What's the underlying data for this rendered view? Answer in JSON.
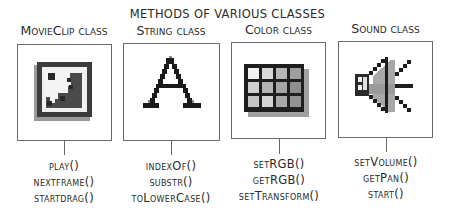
{
  "title": "Methods of various classes",
  "classes": [
    {
      "label": "MovieClip class",
      "icon": "movieclip-icon",
      "methods": [
        "play()",
        "nextFrame()",
        "startDrag()"
      ]
    },
    {
      "label": "String class",
      "icon": "letter-a-icon",
      "methods": [
        "indexOf()",
        "substr()",
        "toLowerCase()"
      ]
    },
    {
      "label": "Color class",
      "icon": "color-grid-icon",
      "methods": [
        "setRGB()",
        "getRGB()",
        "setTransform()"
      ]
    },
    {
      "label": "Sound class",
      "icon": "speaker-icon",
      "methods": [
        "setVolume()",
        "getPan()",
        "start()"
      ]
    }
  ],
  "colors": {
    "line": "#6a6a6a",
    "text": "#2a2a2a",
    "icon_dark": "#1a1a1a",
    "icon_mid": "#555555",
    "icon_shadow": "#9a9a9a"
  }
}
